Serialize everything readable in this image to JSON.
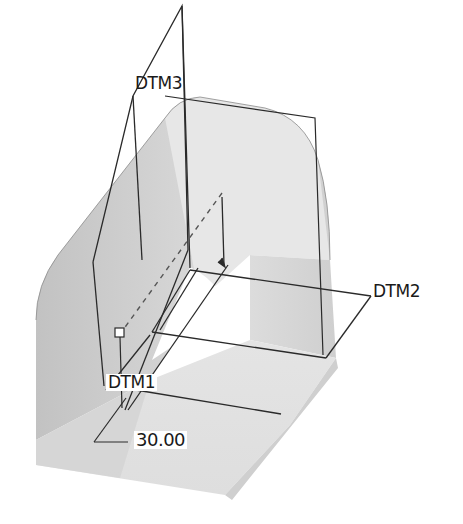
{
  "viewport": {
    "type": "cad-3d-model-view",
    "background": "#ffffff"
  },
  "datum_planes": [
    {
      "id": "dtm1",
      "label": "DTM1"
    },
    {
      "id": "dtm2",
      "label": "DTM2"
    },
    {
      "id": "dtm3",
      "label": "DTM3"
    }
  ],
  "dimension": {
    "value": "30.00"
  },
  "colors": {
    "solid_light": "#e6e6e6",
    "solid_mid": "#d4d4d4",
    "solid_dark": "#bdbdbd",
    "edge": "#2a2a2a",
    "cutout": "#ffffff"
  }
}
